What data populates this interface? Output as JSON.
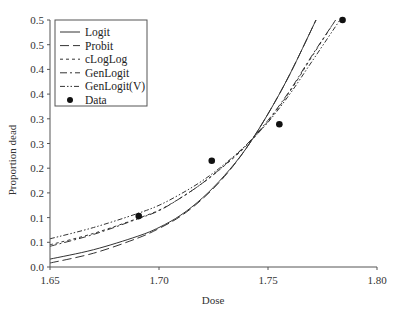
{
  "chart_data": {
    "type": "line",
    "title": "",
    "xlabel": "Dose",
    "ylabel": "Proportion dead",
    "xlim": [
      1.65,
      1.8
    ],
    "ylim": [
      0.0,
      0.5
    ],
    "grid": false,
    "legend_position": "upper left",
    "x_ticks": [
      1.65,
      1.7,
      1.75,
      1.8
    ],
    "x_tick_labels": [
      "1.65",
      "1.70",
      "1.75",
      "1.80"
    ],
    "y_ticks": [
      0.0,
      0.05,
      0.1,
      0.15,
      0.2,
      0.25,
      0.3,
      0.35,
      0.4,
      0.45,
      0.5
    ],
    "y_tick_labels": [
      "0.0",
      "0.1",
      "0.1",
      "0.2",
      "0.2",
      "0.3",
      "0.3",
      "0.4",
      "0.4",
      "0.5",
      "0.5"
    ],
    "series": [
      {
        "name": "Logit",
        "style": "solid",
        "x": [
          1.65,
          1.67,
          1.69,
          1.7,
          1.71,
          1.72,
          1.73,
          1.74,
          1.75,
          1.76,
          1.772
        ],
        "values": [
          0.016,
          0.035,
          0.062,
          0.08,
          0.105,
          0.14,
          0.185,
          0.24,
          0.31,
          0.39,
          0.5
        ]
      },
      {
        "name": "Probit",
        "style": "dashed",
        "x": [
          1.65,
          1.67,
          1.69,
          1.7,
          1.71,
          1.72,
          1.73,
          1.74,
          1.75,
          1.76,
          1.772
        ],
        "values": [
          0.008,
          0.028,
          0.058,
          0.078,
          0.103,
          0.138,
          0.183,
          0.24,
          0.31,
          0.39,
          0.5
        ]
      },
      {
        "name": "cLogLog",
        "style": "short-dashed",
        "x": [
          1.65,
          1.67,
          1.69,
          1.7,
          1.71,
          1.72,
          1.73,
          1.74,
          1.75,
          1.76,
          1.77,
          1.781
        ],
        "values": [
          0.045,
          0.068,
          0.098,
          0.115,
          0.14,
          0.17,
          0.205,
          0.245,
          0.295,
          0.355,
          0.425,
          0.5
        ]
      },
      {
        "name": "GenLogit",
        "style": "dash-dot",
        "x": [
          1.65,
          1.67,
          1.69,
          1.7,
          1.71,
          1.72,
          1.73,
          1.74,
          1.75,
          1.76,
          1.77,
          1.781
        ],
        "values": [
          0.042,
          0.066,
          0.097,
          0.114,
          0.14,
          0.17,
          0.206,
          0.247,
          0.297,
          0.357,
          0.427,
          0.5
        ]
      },
      {
        "name": "GenLogit(V)",
        "style": "dash-dot-dot",
        "x": [
          1.65,
          1.67,
          1.69,
          1.7,
          1.71,
          1.72,
          1.73,
          1.74,
          1.75,
          1.76,
          1.77,
          1.783
        ],
        "values": [
          0.057,
          0.08,
          0.108,
          0.125,
          0.148,
          0.175,
          0.208,
          0.247,
          0.293,
          0.35,
          0.415,
          0.5
        ]
      }
    ],
    "points": {
      "name": "Data",
      "x": [
        1.6907,
        1.7242,
        1.7552,
        1.7842
      ],
      "values": [
        0.103,
        0.215,
        0.289,
        0.5
      ]
    }
  },
  "legend": {
    "items": [
      "Logit",
      "Probit",
      "cLogLog",
      "GenLogit",
      "GenLogit(V)",
      "Data"
    ]
  }
}
